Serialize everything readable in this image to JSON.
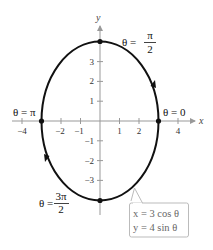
{
  "axes": {
    "x_label": "x",
    "y_label": "y",
    "x_ticks": [
      "−4",
      "−2",
      "−1",
      "1",
      "2",
      "4"
    ],
    "y_ticks": [
      "3",
      "2",
      "1",
      "−1",
      "−2",
      "−3"
    ]
  },
  "points": {
    "theta_pi_over_2": {
      "lhs": "θ =",
      "num": "π",
      "den": "2"
    },
    "theta_zero": {
      "text": "θ = 0"
    },
    "theta_pi": {
      "text": "θ = π"
    },
    "theta_3pi_over_2": {
      "lhs": "θ =",
      "num": "3π",
      "den": "2"
    }
  },
  "equations": {
    "x_eq": "x = 3 cos θ",
    "y_eq": "y = 4 sin θ"
  },
  "colors": {
    "curve": "#111111",
    "axis": "#999999",
    "callout_border": "#bbbbbb",
    "callout_text": "#666666"
  }
}
